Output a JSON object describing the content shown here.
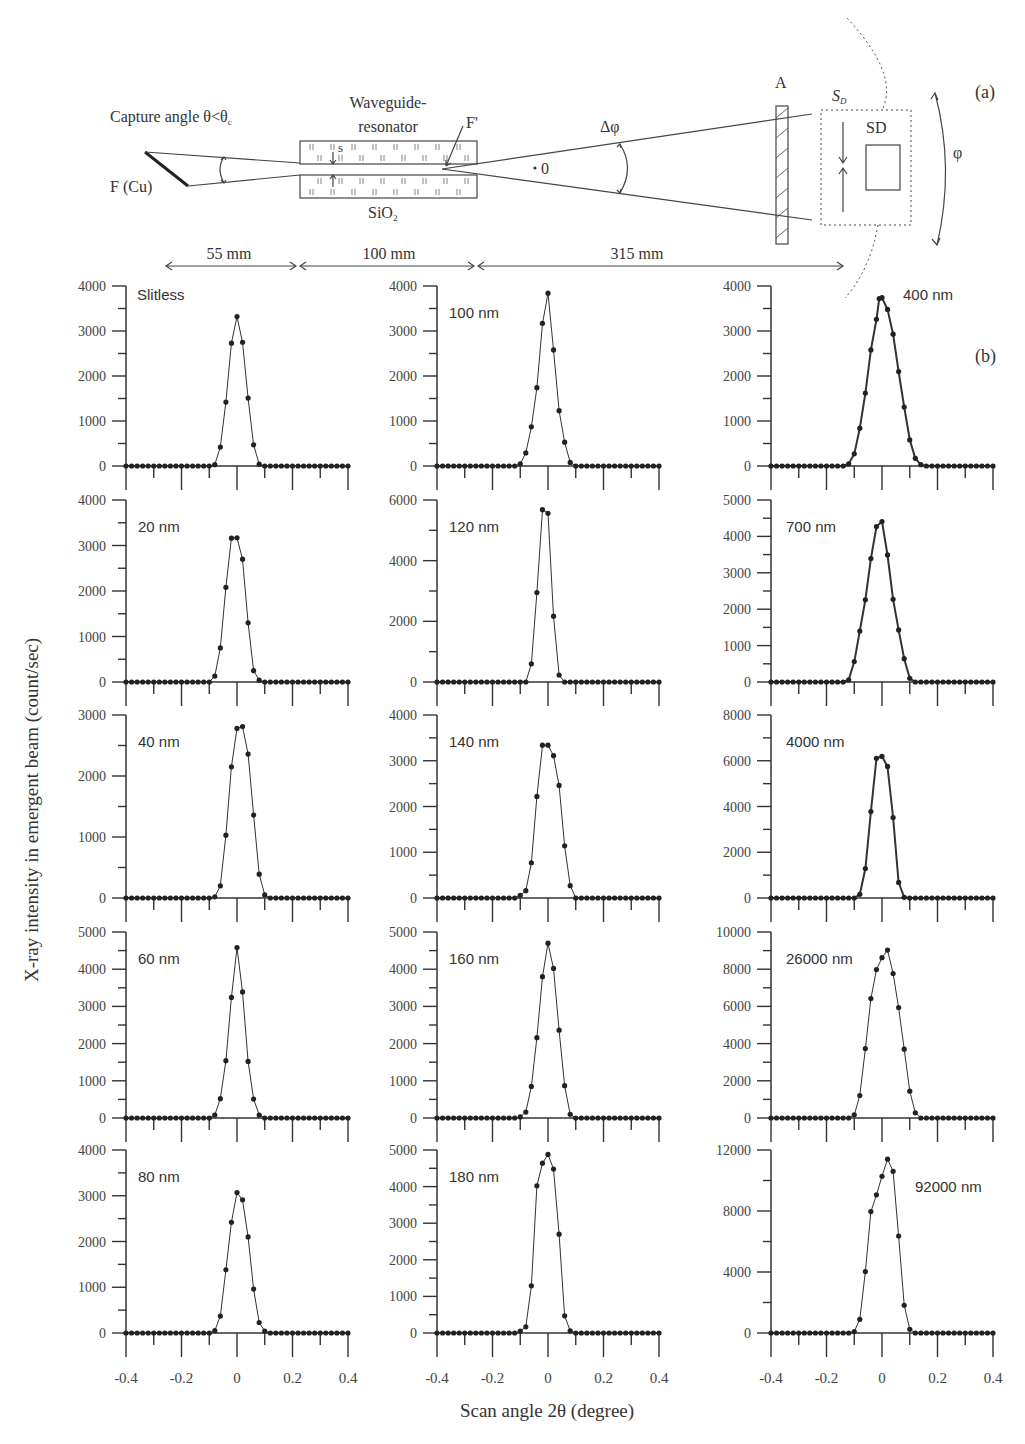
{
  "figure": {
    "panel_a_label": "(a)",
    "panel_b_label": "(b)",
    "y_axis_label": "X-ray intensity in emergent beam (count/sec)",
    "x_axis_label": "Scan angle 2θ (degree)"
  },
  "diagram": {
    "capture_angle_label": "Capture angle θ<θ",
    "capture_angle_subscript": "c",
    "source_label": "F (Cu)",
    "waveguide_label_line1": "Waveguide-",
    "waveguide_label_line2": "resonator",
    "gap_label": "s",
    "focus_label": "F'",
    "material_label": "SiO",
    "material_subscript": "2",
    "divergence_label": "Δφ",
    "origin_label": "0",
    "absorber_label": "A",
    "slit_label": "S",
    "slit_subscript": "D",
    "detector_label": "SD",
    "rotation_label": "φ",
    "distances": [
      "55 mm",
      "100 mm",
      "315 mm"
    ]
  },
  "chart_data": [
    {
      "type": "line",
      "title": "Slitless",
      "xlabel": "Scan angle 2θ (degree)",
      "ylabel": "X-ray intensity in emergent beam (count/sec)",
      "xlim": [
        -0.4,
        0.4
      ],
      "ylim": [
        0,
        4000
      ],
      "yticks": [
        0,
        1000,
        2000,
        3000,
        4000
      ],
      "xticks": [
        -0.4,
        -0.2,
        0,
        0.2,
        0.4
      ],
      "x": [
        -0.08,
        -0.06,
        -0.04,
        -0.02,
        0,
        0.02,
        0.04,
        0.06,
        0.08
      ],
      "values": [
        30,
        420,
        1420,
        2730,
        3320,
        2750,
        1510,
        470,
        40
      ]
    },
    {
      "type": "line",
      "title": "20 nm",
      "xlim": [
        -0.4,
        0.4
      ],
      "ylim": [
        0,
        4000
      ],
      "yticks": [
        0,
        1000,
        2000,
        3000,
        4000
      ],
      "x": [
        -0.08,
        -0.06,
        -0.04,
        -0.02,
        0,
        0.02,
        0.04,
        0.06,
        0.08
      ],
      "values": [
        130,
        750,
        2080,
        3160,
        3170,
        2700,
        1300,
        250,
        40
      ]
    },
    {
      "type": "line",
      "title": "40 nm",
      "xlim": [
        -0.4,
        0.4
      ],
      "ylim": [
        0,
        3000
      ],
      "yticks": [
        0,
        1000,
        2000,
        3000
      ],
      "x": [
        -0.08,
        -0.06,
        -0.04,
        -0.02,
        0,
        0.02,
        0.04,
        0.06,
        0.08,
        0.1
      ],
      "values": [
        20,
        200,
        1030,
        2150,
        2780,
        2810,
        2360,
        1360,
        390,
        50
      ]
    },
    {
      "type": "line",
      "title": "60 nm",
      "xlim": [
        -0.4,
        0.4
      ],
      "ylim": [
        0,
        5000
      ],
      "yticks": [
        0,
        1000,
        2000,
        3000,
        4000,
        5000
      ],
      "x": [
        -0.08,
        -0.06,
        -0.04,
        -0.02,
        0,
        0.02,
        0.04,
        0.06,
        0.08
      ],
      "values": [
        80,
        520,
        1540,
        3240,
        4580,
        3390,
        1520,
        510,
        80
      ]
    },
    {
      "type": "line",
      "title": "80 nm",
      "xlim": [
        -0.4,
        0.4
      ],
      "ylim": [
        0,
        4000
      ],
      "yticks": [
        0,
        1000,
        2000,
        3000,
        4000
      ],
      "x": [
        -0.08,
        -0.06,
        -0.04,
        -0.02,
        0,
        0.02,
        0.04,
        0.06,
        0.08,
        0.1
      ],
      "values": [
        50,
        370,
        1380,
        2420,
        3070,
        2910,
        2100,
        960,
        230,
        40
      ]
    },
    {
      "type": "line",
      "title": "100 nm",
      "xlim": [
        -0.4,
        0.4
      ],
      "ylim": [
        0,
        4000
      ],
      "yticks": [
        0,
        1000,
        2000,
        3000,
        4000
      ],
      "x": [
        -0.1,
        -0.08,
        -0.06,
        -0.04,
        -0.02,
        0,
        0.02,
        0.04,
        0.06,
        0.08
      ],
      "values": [
        50,
        290,
        870,
        1740,
        3170,
        3840,
        2580,
        1230,
        530,
        80
      ]
    },
    {
      "type": "line",
      "title": "120 nm",
      "xlim": [
        -0.4,
        0.4
      ],
      "ylim": [
        0,
        6000
      ],
      "yticks": [
        0,
        2000,
        4000,
        6000
      ],
      "x": [
        -0.06,
        -0.04,
        -0.02,
        0,
        0.02,
        0.04
      ],
      "values": [
        600,
        2950,
        5680,
        5560,
        2170,
        230
      ]
    },
    {
      "type": "line",
      "title": "140 nm",
      "xlim": [
        -0.4,
        0.4
      ],
      "ylim": [
        0,
        4000
      ],
      "yticks": [
        0,
        1000,
        2000,
        3000,
        4000
      ],
      "x": [
        -0.1,
        -0.08,
        -0.06,
        -0.04,
        -0.02,
        0,
        0.02,
        0.04,
        0.06,
        0.08
      ],
      "values": [
        60,
        160,
        770,
        2220,
        3340,
        3340,
        3110,
        2460,
        1140,
        270
      ]
    },
    {
      "type": "line",
      "title": "160 nm",
      "xlim": [
        -0.4,
        0.4
      ],
      "ylim": [
        0,
        5000
      ],
      "yticks": [
        0,
        1000,
        2000,
        3000,
        4000,
        5000
      ],
      "x": [
        -0.1,
        -0.08,
        -0.06,
        -0.04,
        -0.02,
        0,
        0.02,
        0.04,
        0.06,
        0.08
      ],
      "values": [
        30,
        160,
        850,
        2160,
        3800,
        4700,
        4020,
        2360,
        870,
        100
      ]
    },
    {
      "type": "line",
      "title": "180 nm",
      "xlim": [
        -0.4,
        0.4
      ],
      "ylim": [
        0,
        5000
      ],
      "yticks": [
        0,
        1000,
        2000,
        3000,
        4000,
        5000
      ],
      "x": [
        -0.1,
        -0.08,
        -0.06,
        -0.04,
        -0.02,
        0,
        0.02,
        0.04,
        0.06,
        0.08
      ],
      "values": [
        50,
        170,
        1290,
        4020,
        4640,
        4880,
        4480,
        2700,
        470,
        60
      ]
    },
    {
      "type": "line",
      "title": "400 nm",
      "xlim": [
        -0.4,
        0.4
      ],
      "ylim": [
        0,
        4000
      ],
      "yticks": [
        0,
        1000,
        2000,
        3000,
        4000
      ],
      "x": [
        -0.12,
        -0.1,
        -0.08,
        -0.06,
        -0.04,
        -0.02,
        -0.01,
        0,
        0.02,
        0.04,
        0.06,
        0.08,
        0.1,
        0.12,
        0.14
      ],
      "values": [
        50,
        270,
        840,
        1620,
        2580,
        3260,
        3720,
        3740,
        3480,
        2930,
        2100,
        1310,
        580,
        170,
        30
      ]
    },
    {
      "type": "line",
      "title": "700 nm",
      "xlim": [
        -0.4,
        0.4
      ],
      "ylim": [
        0,
        5000
      ],
      "yticks": [
        0,
        1000,
        2000,
        3000,
        4000,
        5000
      ],
      "x": [
        -0.12,
        -0.1,
        -0.08,
        -0.06,
        -0.04,
        -0.02,
        0,
        0.02,
        0.04,
        0.06,
        0.08,
        0.1
      ],
      "values": [
        60,
        560,
        1400,
        2260,
        3390,
        4270,
        4410,
        3490,
        2270,
        1430,
        640,
        100
      ]
    },
    {
      "type": "line",
      "title": "4000 nm",
      "xlim": [
        -0.4,
        0.4
      ],
      "ylim": [
        0,
        8000
      ],
      "yticks": [
        0,
        2000,
        4000,
        6000,
        8000
      ],
      "x": [
        -0.08,
        -0.06,
        -0.04,
        -0.02,
        0,
        0.02,
        0.04,
        0.06,
        0.08
      ],
      "values": [
        160,
        1290,
        3780,
        6110,
        6190,
        5750,
        3520,
        680,
        30
      ]
    },
    {
      "type": "line",
      "title": "26000 nm",
      "xlim": [
        -0.4,
        0.4
      ],
      "ylim": [
        0,
        10000
      ],
      "yticks": [
        0,
        2000,
        4000,
        6000,
        8000,
        10000
      ],
      "x": [
        -0.1,
        -0.08,
        -0.06,
        -0.04,
        -0.02,
        0,
        0.02,
        0.04,
        0.06,
        0.08,
        0.1,
        0.12
      ],
      "values": [
        170,
        1210,
        3730,
        6420,
        7980,
        8620,
        9030,
        7770,
        5940,
        3700,
        1440,
        280
      ]
    },
    {
      "type": "line",
      "title": "92000 nm",
      "xlim": [
        -0.4,
        0.4
      ],
      "ylim": [
        0,
        12000
      ],
      "yticks": [
        0,
        4000,
        8000,
        12000
      ],
      "x": [
        -0.1,
        -0.08,
        -0.06,
        -0.04,
        -0.02,
        0,
        0.02,
        0.04,
        0.06,
        0.08,
        0.1
      ],
      "values": [
        100,
        900,
        4030,
        7960,
        9060,
        10280,
        11400,
        10600,
        6360,
        1820,
        240
      ]
    }
  ]
}
